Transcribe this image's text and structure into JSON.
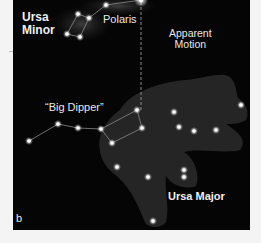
{
  "labels": {
    "ursa_minor_line1": "Ursa",
    "ursa_minor_line2": "Minor",
    "polaris": "Polaris",
    "apparent_motion_line1": "Apparent",
    "apparent_motion_line2": "Motion",
    "big_dipper": "“Big Dipper”",
    "ursa_major": "Ursa Major",
    "panel_letter": "b"
  },
  "colors": {
    "background": "#050505",
    "star": "#ffffff",
    "line": "#9a9a9a",
    "bear": "#3a3a3a"
  },
  "stars": {
    "ursa_minor": [
      [
        106,
        5
      ],
      [
        78,
        14
      ],
      [
        89,
        18
      ],
      [
        67,
        34
      ],
      [
        80,
        37
      ]
    ],
    "polaris": [
      141,
      0
    ],
    "big_dipper": [
      [
        29,
        141
      ],
      [
        58,
        124
      ],
      [
        78,
        128
      ],
      [
        101,
        129
      ],
      [
        137,
        110
      ],
      [
        142,
        128
      ],
      [
        112,
        143
      ]
    ],
    "ursa_major_other": [
      [
        174,
        112
      ],
      [
        241,
        105
      ],
      [
        179,
        127
      ],
      [
        194,
        131
      ],
      [
        216,
        130
      ],
      [
        117,
        167
      ],
      [
        148,
        177
      ],
      [
        184,
        170
      ],
      [
        184,
        177
      ],
      [
        153,
        221
      ]
    ]
  }
}
